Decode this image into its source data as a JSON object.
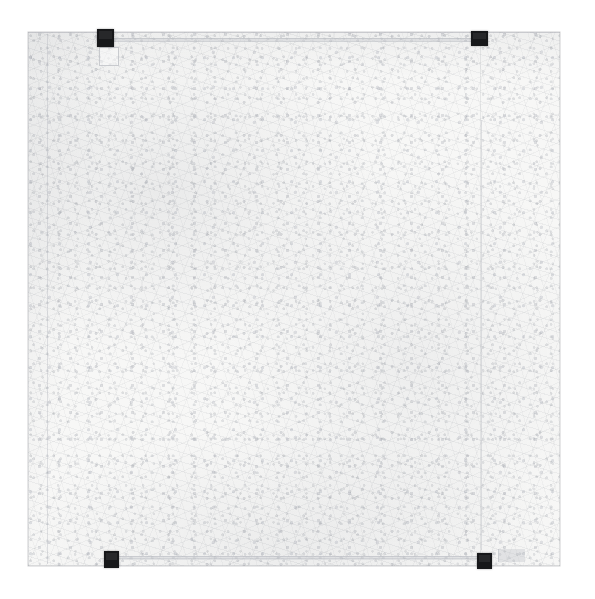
{
  "image": {
    "title": "Near-blank white textured sheet with four black corner markers",
    "medium": "scanned sheet photograph",
    "width_px": "595",
    "height_px": "599",
    "background_color": "#ffffff"
  },
  "sheet": {
    "label": "paper-sheet",
    "base_color": "#f7f7f6",
    "edge_color": "#a3a6ad",
    "texture": "mottled fibrous paper",
    "left_px": "28",
    "top_px": "32",
    "width_px": "532",
    "height_px": "534"
  },
  "markers": [
    {
      "name": "top-left",
      "color": "#17181a",
      "x": "97",
      "y": "29",
      "w": "17",
      "h": "18"
    },
    {
      "name": "top-right",
      "color": "#17181a",
      "x": "471",
      "y": "31",
      "w": "17",
      "h": "15"
    },
    {
      "name": "bottom-left",
      "color": "#17181a",
      "x": "104",
      "y": "551",
      "w": "15",
      "h": "17"
    },
    {
      "name": "bottom-right",
      "color": "#17181a",
      "x": "477",
      "y": "553",
      "w": "15",
      "h": "16"
    }
  ],
  "guides": {
    "left_margin_label": "left vertical pencil guide",
    "right_margin_label": "right vertical pencil guide",
    "top_rule_label": "upper horizontal rule",
    "bottom_rule_label": "lower horizontal rule",
    "guide_color": "#a8abb2"
  },
  "details": {
    "ghost_square_label": "faint outlined square under top-left marker",
    "faint_mark_label": "faint gray mark right of bottom-right marker",
    "trace_label": "faint vertical trace near right edge"
  },
  "caption": "Near-blank white textured sheet with four black corner markers"
}
